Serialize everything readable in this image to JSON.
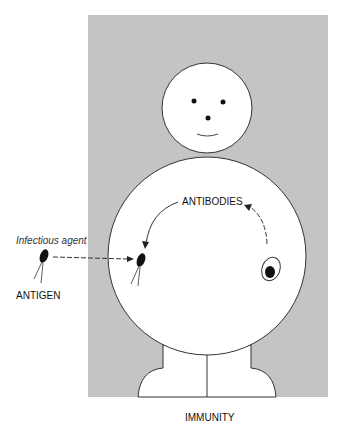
{
  "diagram": {
    "caption": "IMMUNITY",
    "labels": {
      "infectious_agent": "Infectious agent",
      "antigen": "ANTIGEN",
      "antibodies": "ANTIBODIES"
    },
    "colors": {
      "background_panel": "#c4c4c4",
      "figure_fill": "#ffffff",
      "stroke": "#222222"
    }
  }
}
